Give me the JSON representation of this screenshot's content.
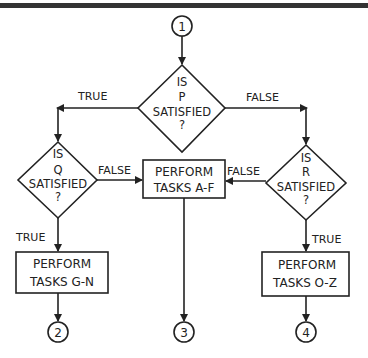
{
  "connectors": {
    "start": "1",
    "end_tasks_g_n": "2",
    "end_tasks_a_f": "3",
    "end_tasks_o_z": "4"
  },
  "decisions": {
    "p": {
      "line1": "IS",
      "line2": "P",
      "line3": "SATISFIED",
      "line4": "?"
    },
    "q": {
      "line1": "IS",
      "line2": "Q",
      "line3": "SATISFIED",
      "line4": "?"
    },
    "r": {
      "line1": "IS",
      "line2": "R",
      "line3": "SATISFIED",
      "line4": "?"
    }
  },
  "processes": {
    "a_f": {
      "line1": "PERFORM",
      "line2": "TASKS A-F"
    },
    "g_n": {
      "line1": "PERFORM",
      "line2": "TASKS G-N"
    },
    "o_z": {
      "line1": "PERFORM",
      "line2": "TASKS O-Z"
    }
  },
  "edge_labels": {
    "p_true": "TRUE",
    "p_false": "FALSE",
    "q_false": "FALSE",
    "q_true": "TRUE",
    "r_false": "FALSE",
    "r_true": "TRUE"
  },
  "colors": {
    "ink": "#222222",
    "background": "#ffffff",
    "top_bar": "#333333"
  }
}
